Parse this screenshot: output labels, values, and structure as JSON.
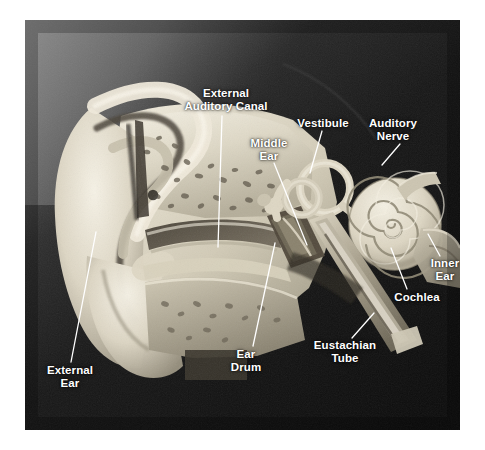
{
  "figure": {
    "kind": "anatomical-photograph",
    "background_color": "#ffffff",
    "photo": {
      "left": 25,
      "top": 20,
      "width": 435,
      "height": 410,
      "backdrop_dark": "#121212",
      "backdrop_light": "#8a8a8a",
      "model_color": "#e7e2d2"
    }
  },
  "labels": [
    {
      "id": "external-auditory-canal",
      "text": "External\nAuditory Canal",
      "x": 176,
      "y": 87,
      "w": 100,
      "leader": [
        [
          222,
          116
        ],
        [
          218,
          247
        ]
      ]
    },
    {
      "id": "middle-ear",
      "text": "Middle\nEar",
      "x": 236,
      "y": 137,
      "w": 66,
      "leader": [
        [
          274,
          163
        ],
        [
          307,
          245
        ]
      ]
    },
    {
      "id": "vestibule",
      "text": "Vestibule",
      "x": 292,
      "y": 117,
      "w": 62,
      "leader": [
        [
          322,
          131
        ],
        [
          310,
          173
        ]
      ]
    },
    {
      "id": "auditory-nerve",
      "text": "Auditory\nNerve",
      "x": 362,
      "y": 117,
      "w": 62,
      "leader": [
        [
          400,
          144
        ],
        [
          382,
          165
        ]
      ]
    },
    {
      "id": "inner-ear",
      "text": "Inner\nEar",
      "x": 421,
      "y": 257,
      "w": 48,
      "leader": [
        [
          440,
          256
        ],
        [
          428,
          234
        ]
      ]
    },
    {
      "id": "cochlea",
      "text": "Cochlea",
      "x": 389,
      "y": 291,
      "w": 56,
      "leader": [
        [
          407,
          289
        ],
        [
          391,
          248
        ]
      ]
    },
    {
      "id": "eustachian-tube",
      "text": "Eustachian\nTube",
      "x": 306,
      "y": 339,
      "w": 78,
      "leader": [
        [
          352,
          338
        ],
        [
          374,
          313
        ]
      ]
    },
    {
      "id": "ear-drum",
      "text": "Ear\nDrum",
      "x": 222,
      "y": 348,
      "w": 48,
      "leader": [
        [
          253,
          346
        ],
        [
          275,
          243
        ]
      ]
    },
    {
      "id": "external-ear",
      "text": "External\nEar",
      "x": 38,
      "y": 364,
      "w": 64,
      "leader": [
        [
          71,
          362
        ],
        [
          96,
          232
        ]
      ]
    }
  ]
}
